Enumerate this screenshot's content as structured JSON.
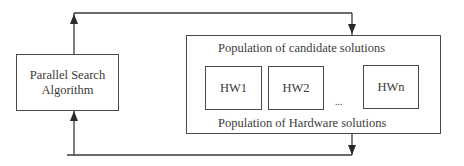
{
  "diagram": {
    "algorithm_box": {
      "line1": "Parallel Search",
      "line2": "Algorithm"
    },
    "population_box": {
      "top_label": "Population of candidate solutions",
      "bottom_label": "Population of Hardware solutions",
      "items": [
        "HW1",
        "HW2",
        "HWn"
      ],
      "ellipsis": "..."
    },
    "connections": [
      {
        "from": "Parallel Search Algorithm",
        "to": "Population of candidate solutions",
        "route": "top loop"
      },
      {
        "from": "Population of Hardware solutions",
        "to": "Parallel Search Algorithm",
        "route": "bottom loop"
      }
    ],
    "colors": {
      "line": "#3a3a3a",
      "background": "#ffffff"
    }
  }
}
